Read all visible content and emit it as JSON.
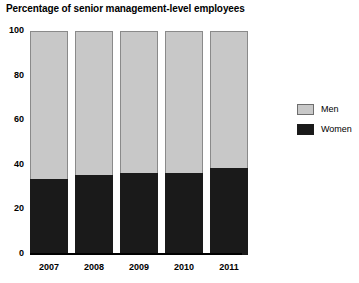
{
  "chart_data": {
    "type": "bar",
    "title": "Percentage of senior management-level employees",
    "xlabel": "",
    "ylabel": "",
    "ylim": [
      0,
      100
    ],
    "yticks": [
      0,
      20,
      40,
      60,
      80,
      100
    ],
    "ytick_labels": [
      "0",
      "20",
      "40",
      "60",
      "80",
      "100"
    ],
    "categories": [
      "2007",
      "2008",
      "2009",
      "2010",
      "2011"
    ],
    "stacked": true,
    "grid": false,
    "legend_position": "right",
    "series": [
      {
        "name": "Men",
        "color": "#c8c8c8",
        "values": [
          66,
          64,
          63,
          63,
          61
        ]
      },
      {
        "name": "Women",
        "color": "#1a1a1a",
        "values": [
          34,
          36,
          37,
          37,
          39
        ]
      }
    ]
  },
  "legend": {
    "items": [
      {
        "label": "Men",
        "swatch": "men"
      },
      {
        "label": "Women",
        "swatch": "women"
      }
    ]
  }
}
